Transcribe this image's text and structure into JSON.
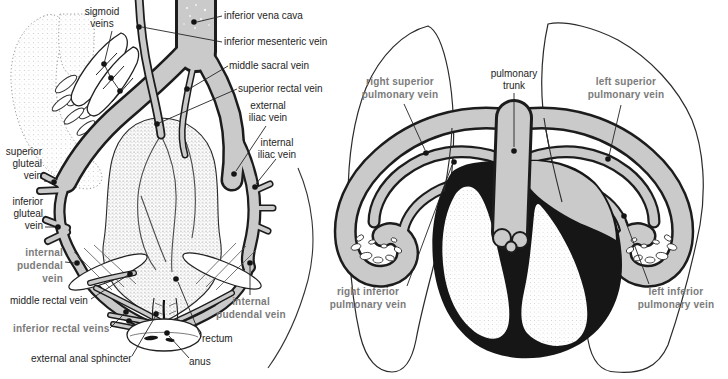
{
  "figure": {
    "width": 728,
    "height": 379,
    "background": "#ffffff",
    "colors": {
      "vein_gray": "#cacaca",
      "outline_black": "#1c1c1c",
      "bold_label_gray": "#7b7b7b",
      "label_black": "#1e1e1e"
    }
  },
  "left_panel": {
    "title": "pelvic veins illustration",
    "labels": {
      "sigmoid_veins": {
        "lines": [
          "sigmoid",
          "veins"
        ]
      },
      "inferior_vena_cava": {
        "text": "inferior vena cava"
      },
      "inferior_mesenteric_vein": {
        "text": "inferior mesenteric vein"
      },
      "middle_sacral_vein": {
        "text": "middle sacral vein"
      },
      "superior_rectal_vein": {
        "text": "superior rectal vein"
      },
      "external_iliac_vein": {
        "lines": [
          "external",
          "iliac vein"
        ]
      },
      "internal_iliac_vein": {
        "lines": [
          "internal",
          "iliac vein"
        ]
      },
      "superior_gluteal_vein": {
        "lines": [
          "superior",
          "gluteal",
          "vein"
        ]
      },
      "inferior_gluteal_vein": {
        "lines": [
          "inferior",
          "gluteal",
          "vein"
        ]
      },
      "internal_pudendal_vein_left": {
        "lines": [
          "internal",
          "pudendal",
          "vein"
        ]
      },
      "middle_rectal_vein": {
        "text": "middle rectal vein"
      },
      "inferior_rectal_veins": {
        "text": "inferior rectal veins"
      },
      "internal_pudendal_vein_right": {
        "lines": [
          "internal",
          "pudendal vein"
        ]
      },
      "rectum": {
        "text": "rectum"
      },
      "external_anal_sphincter": {
        "text": "external anal sphincter"
      },
      "anus": {
        "text": "anus"
      }
    }
  },
  "right_panel": {
    "title": "pulmonary veins illustration",
    "labels": {
      "right_superior_pulmonary_vein": {
        "lines": [
          "right superior",
          "pulmonary vein"
        ]
      },
      "pulmonary_trunk": {
        "lines": [
          "pulmonary",
          "trunk"
        ]
      },
      "left_superior_pulmonary_vein": {
        "lines": [
          "left superior",
          "pulmonary vein"
        ]
      },
      "right_inferior_pulmonary_vein": {
        "lines": [
          "right inferior",
          "pulmonary vein"
        ]
      },
      "left_inferior_pulmonary_vein": {
        "lines": [
          "left inferior",
          "pulmonary vein"
        ]
      }
    }
  }
}
